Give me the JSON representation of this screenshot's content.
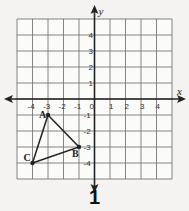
{
  "figure": {
    "number_label": "1",
    "axes": {
      "x_label": "x",
      "y_label": "y"
    },
    "x_ticks": [
      "-4",
      "-3",
      "-2",
      "-1",
      "0",
      "1",
      "2",
      "3",
      "4"
    ],
    "y_ticks_pos": [
      "4",
      "3",
      "2",
      "1"
    ],
    "y_ticks_neg": [
      "-1",
      "-2",
      "-3",
      "-4"
    ],
    "grid_range": {
      "xmin": -5,
      "xmax": 5,
      "ymin": -5,
      "ymax": 5
    },
    "triangle": {
      "vertices": [
        {
          "label": "A",
          "x": -3,
          "y": -1
        },
        {
          "label": "B",
          "x": -1,
          "y": -3
        },
        {
          "label": "C",
          "x": -4,
          "y": -4
        }
      ]
    }
  }
}
